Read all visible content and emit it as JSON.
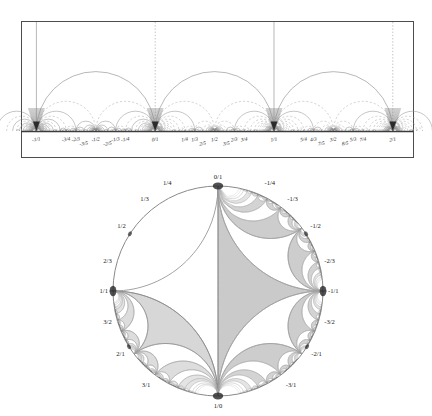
{
  "figure": {
    "colors": {
      "frame": "#4d4d4d",
      "axis": "#3c3c3c",
      "arc_solid": "#8c8c8c",
      "arc_dashed": "#a8a8a8",
      "vertical_solid": "#9a9a9a",
      "vertical_dotted": "#b4b4b4",
      "cusp": "#2b2b2b",
      "disk_outline": "#8a8a8a",
      "tile_fill": "#c8c8c8",
      "tile_fill_light": "#dcdcdc",
      "text": "#1a1a1a",
      "background": "#ffffff"
    }
  },
  "upper_half_plane": {
    "name": "upper-half-plane-diagram",
    "axis_label_row_y": 141,
    "unit_px": 118.8,
    "origin_x": 155.2,
    "baseline_y": 131,
    "frame": {
      "x": 21,
      "y": 21,
      "width": 392,
      "height": 136
    },
    "vertical_geodesics": [
      {
        "label": "-1/1",
        "value": -1,
        "style": "solid"
      },
      {
        "label": "0/1",
        "value": 0,
        "style": "dotted"
      },
      {
        "label": "1/1",
        "value": 1,
        "style": "solid"
      },
      {
        "label": "2/1",
        "value": 2,
        "style": "dotted"
      }
    ],
    "cusps": [
      {
        "label": "-1/1",
        "value": -1,
        "major": true
      },
      {
        "label": "0/1",
        "value": 0,
        "major": true
      },
      {
        "label": "1/1",
        "value": 1,
        "major": true
      },
      {
        "label": "2/1",
        "value": 2,
        "major": true
      }
    ],
    "tick_labels": [
      {
        "text": "-1/1",
        "value": -1,
        "row": 0
      },
      {
        "text": "-3/4",
        "value": -0.75,
        "row": 0
      },
      {
        "text": "-2/3",
        "value": -0.6667,
        "row": 0
      },
      {
        "text": "-3/5",
        "value": -0.6,
        "row": 1
      },
      {
        "text": "-1/2",
        "value": -0.5,
        "row": 0
      },
      {
        "text": "-2/5",
        "value": -0.4,
        "row": 1
      },
      {
        "text": "-1/3",
        "value": -0.3333,
        "row": 0
      },
      {
        "text": "-1/4",
        "value": -0.25,
        "row": 0
      },
      {
        "text": "0/1",
        "value": 0,
        "row": 0
      },
      {
        "text": "1/4",
        "value": 0.25,
        "row": 0
      },
      {
        "text": "1/3",
        "value": 0.3333,
        "row": 0
      },
      {
        "text": "2/5",
        "value": 0.4,
        "row": 1
      },
      {
        "text": "1/2",
        "value": 0.5,
        "row": 0
      },
      {
        "text": "3/5",
        "value": 0.6,
        "row": 1
      },
      {
        "text": "2/3",
        "value": 0.6667,
        "row": 0
      },
      {
        "text": "3/4",
        "value": 0.75,
        "row": 0
      },
      {
        "text": "1/1",
        "value": 1,
        "row": 0
      },
      {
        "text": "5/4",
        "value": 1.25,
        "row": 0
      },
      {
        "text": "4/3",
        "value": 1.3333,
        "row": 0
      },
      {
        "text": "7/5",
        "value": 1.4,
        "row": 1
      },
      {
        "text": "3/2",
        "value": 1.5,
        "row": 0
      },
      {
        "text": "8/5",
        "value": 1.6,
        "row": 1
      },
      {
        "text": "5/3",
        "value": 1.6667,
        "row": 0
      },
      {
        "text": "7/4",
        "value": 1.75,
        "row": 0
      },
      {
        "text": "2/1",
        "value": 2,
        "row": 0
      }
    ]
  },
  "poincare_disk": {
    "name": "poincare-disk-diagram",
    "center_x": 218,
    "center_y": 291,
    "radius": 105,
    "boundary_labels": [
      {
        "text": "0/1",
        "angle_deg": 90
      },
      {
        "text": "1/4",
        "angle_deg": 115
      },
      {
        "text": "1/3",
        "angle_deg": 129
      },
      {
        "text": "1/2",
        "angle_deg": 147
      },
      {
        "text": "2/3",
        "angle_deg": 165
      },
      {
        "text": "1/1",
        "angle_deg": 180
      },
      {
        "text": "3/2",
        "angle_deg": 195
      },
      {
        "text": "2/1",
        "angle_deg": 212
      },
      {
        "text": "3/1",
        "angle_deg": 232
      },
      {
        "text": "1/0",
        "angle_deg": 270
      },
      {
        "text": "-3/1",
        "angle_deg": 308
      },
      {
        "text": "-2/1",
        "angle_deg": 328
      },
      {
        "text": "-3/2",
        "angle_deg": 345
      },
      {
        "text": "-1/1",
        "angle_deg": 0
      },
      {
        "text": "-2/3",
        "angle_deg": 15
      },
      {
        "text": "-1/2",
        "angle_deg": 33
      },
      {
        "text": "-1/3",
        "angle_deg": 51
      },
      {
        "text": "-1/4",
        "angle_deg": 65
      }
    ],
    "cusp_points": [
      {
        "text": "0/1",
        "angle_deg": 90
      },
      {
        "text": "1/1",
        "angle_deg": 180
      },
      {
        "text": "1/0",
        "angle_deg": 270
      },
      {
        "text": "-1/1",
        "angle_deg": 0
      },
      {
        "text": "1/2",
        "angle_deg": 147
      },
      {
        "text": "2/1",
        "angle_deg": 212
      },
      {
        "text": "-2/1",
        "angle_deg": 328
      },
      {
        "text": "-1/2",
        "angle_deg": 33
      }
    ]
  }
}
